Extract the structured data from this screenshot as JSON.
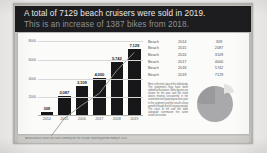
{
  "banner": {
    "line1": "A total of 7129 beach cruisers were sold in 2019.",
    "line2": "This is an increase of 1387 bikes from 2018."
  },
  "chart_data": {
    "type": "bar",
    "title": "",
    "xlabel": "",
    "ylabel": "",
    "categories": [
      "2014",
      "2015",
      "2016",
      "2017",
      "2018",
      "2019"
    ],
    "values": [
      309,
      2087,
      3109,
      4000,
      5742,
      7129
    ],
    "value_labels": [
      "309",
      "2,087",
      "3,109",
      "4,000",
      "5,742",
      "7,129"
    ],
    "ylim": [
      0,
      8000
    ],
    "yticks": [
      2000,
      4000,
      6000,
      8000
    ],
    "ytick_labels": [
      "2000",
      "4000",
      "6000",
      "8000"
    ],
    "grid": true,
    "legend": "none",
    "bar_color": "#17171a",
    "trendline": true
  },
  "table": {
    "rows": [
      {
        "name": "Beach",
        "year": "2014",
        "value": "309"
      },
      {
        "name": "Beach",
        "year": "2015",
        "value": "2087"
      },
      {
        "name": "Beach",
        "year": "2016",
        "value": "3109"
      },
      {
        "name": "Beach",
        "year": "2017",
        "value": "4000"
      },
      {
        "name": "Beach",
        "year": "2018",
        "value": "5742"
      },
      {
        "name": "Beach",
        "year": "2019",
        "value": "7129"
      }
    ]
  },
  "body_copy": {
    "text": "Here is the text copy of the slide body. The statements may have been edited for illustration. Sales figures are shown for the year and the trend above moving consistently in the same direction upward year over year in the segment and the results show growth through the full six year period. The chart at left and the table alongside summarize the same values for review."
  },
  "pie_chart": {
    "type": "pie",
    "labels": [
      "Other",
      "Highlighted"
    ],
    "values": [
      75,
      25
    ],
    "colors": [
      "#a9a9ab",
      "#e3e3e1"
    ],
    "exploded_slice": "Highlighted"
  },
  "caption": {
    "text": "Annual beach cruiser unit sales summary for the six year reporting period ending in 2019."
  },
  "colors": {
    "banner_bg": "#1d1d1f",
    "banner_text": "#e9e9ea",
    "banner_subtext": "#8f9196",
    "slide_bg": "#fbfbfa",
    "mount": "#c6c5c1",
    "bar": "#17171a"
  }
}
